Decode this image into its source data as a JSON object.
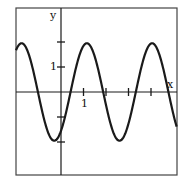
{
  "chart_data": {
    "type": "line",
    "title": "",
    "xlabel": "x",
    "ylabel": "y",
    "xlim": [
      -2.0,
      5.15
    ],
    "ylim": [
      -3.3,
      3.35
    ],
    "grid": false,
    "legend": null,
    "x_ticks": [
      1,
      2,
      3,
      4
    ],
    "x_tick_labels": [
      "1"
    ],
    "y_ticks": [
      -2,
      -1,
      1,
      2
    ],
    "y_tick_labels": [
      "1"
    ],
    "series": [
      {
        "name": "curve",
        "description": "sinusoid, amplitude ~2, period ~2.9",
        "amplitude": 1.95,
        "period": 2.9,
        "peak_x": [
          -1.73,
          1.15,
          4.04
        ],
        "trough_x": [
          -0.27,
          2.6
        ],
        "x": [
          -2.0,
          -1.73,
          -1.0,
          -0.27,
          0.0,
          0.45,
          1.15,
          1.85,
          2.6,
          3.3,
          4.04,
          4.75,
          5.15
        ],
        "y": [
          1.78,
          1.95,
          0.0,
          -1.95,
          -1.5,
          0.0,
          1.95,
          0.0,
          -1.95,
          0.0,
          1.95,
          0.0,
          -1.45
        ]
      }
    ],
    "colors": {
      "line": "#1a1a1a",
      "axes": "#1a1a1a",
      "frame": "#333333"
    }
  },
  "labels": {
    "x_axis": "x",
    "y_axis": "y",
    "x_tick_one": "1",
    "y_tick_one": "1"
  }
}
